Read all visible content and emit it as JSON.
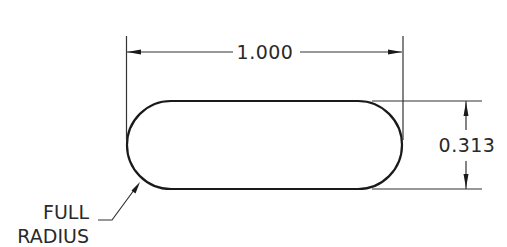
{
  "drawing": {
    "type": "engineering-dimension-drawing",
    "part_shape": "obround-slot",
    "dimensions": {
      "length": {
        "label": "1.000",
        "value": 1.0
      },
      "width": {
        "label": "0.313",
        "value": 0.313
      }
    },
    "note": {
      "line1": "FULL",
      "line2": "RADIUS"
    },
    "colors": {
      "background": "#ffffff",
      "outline": "#1a1a1a",
      "dimension_lines": "#333333",
      "text": "#2a2a2a"
    }
  }
}
